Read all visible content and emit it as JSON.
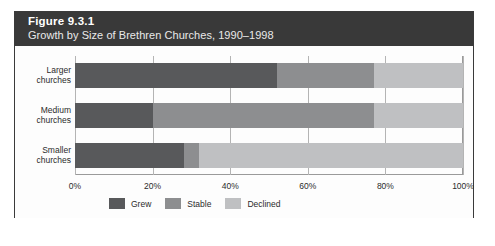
{
  "figure": {
    "title": "Figure 9.3.1",
    "subtitle": "Growth by Size of Brethren Churches, 1990–1998"
  },
  "chart_data": {
    "type": "bar",
    "orientation": "horizontal",
    "stacked": true,
    "stack_mode": "percent",
    "title": "Growth by Size of Brethren Churches, 1990–1998",
    "xlabel": "",
    "ylabel": "",
    "xlim": [
      0,
      100
    ],
    "xticks": [
      0,
      20,
      40,
      60,
      80,
      100
    ],
    "xtick_labels": [
      "0%",
      "20%",
      "40%",
      "60%",
      "80%",
      "100%"
    ],
    "grid": true,
    "legend_position": "bottom-left",
    "categories": [
      "Larger churches",
      "Medium churches",
      "Smaller churches"
    ],
    "category_lines": [
      [
        "Larger",
        "churches"
      ],
      [
        "Medium",
        "churches"
      ],
      [
        "Smaller",
        "churches"
      ]
    ],
    "series": [
      {
        "name": "Grew",
        "color": "#58595b",
        "values": [
          52,
          20,
          28
        ]
      },
      {
        "name": "Stable",
        "color": "#8d8e90",
        "values": [
          25,
          57,
          4
        ]
      },
      {
        "name": "Declined",
        "color": "#bfc0c2",
        "values": [
          23,
          23,
          68
        ]
      }
    ]
  },
  "colors": {
    "header_background": "#393939",
    "header_text": "#ffffff",
    "panel_background": "#fdfdfd",
    "frame_border": "#3a3a3a",
    "axis": "#9a9a9a",
    "gridline": "#b4b4b4",
    "label_text": "#2b2b2b"
  }
}
